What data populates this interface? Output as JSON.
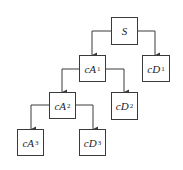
{
  "diagram": {
    "type": "wavelet-decomposition-tree",
    "nodes": [
      {
        "id": "S",
        "base": "S",
        "sub": "",
        "x": 111,
        "y": 17,
        "w": 27,
        "h": 28
      },
      {
        "id": "cA1",
        "base": "cA",
        "sub": "1",
        "x": 79,
        "y": 55,
        "w": 27,
        "h": 27
      },
      {
        "id": "cD1",
        "base": "cD",
        "sub": "1",
        "x": 142,
        "y": 55,
        "w": 28,
        "h": 27
      },
      {
        "id": "cA2",
        "base": "cA",
        "sub": "2",
        "x": 49,
        "y": 92,
        "w": 27,
        "h": 27
      },
      {
        "id": "cD2",
        "base": "cD",
        "sub": "2",
        "x": 111,
        "y": 92,
        "w": 27,
        "h": 28
      },
      {
        "id": "cA3",
        "base": "cA",
        "sub": "3",
        "x": 17,
        "y": 129,
        "w": 27,
        "h": 27
      },
      {
        "id": "cD3",
        "base": "cD",
        "sub": "3",
        "x": 79,
        "y": 129,
        "w": 27,
        "h": 27
      }
    ],
    "edges": [
      {
        "from": "S",
        "to": "cA1"
      },
      {
        "from": "S",
        "to": "cD1"
      },
      {
        "from": "cA1",
        "to": "cA2"
      },
      {
        "from": "cA1",
        "to": "cD2"
      },
      {
        "from": "cA2",
        "to": "cA3"
      },
      {
        "from": "cA2",
        "to": "cD3"
      }
    ],
    "colors": {
      "stroke": "#3a3a3a",
      "fill": "#ffffff",
      "text": "#222222"
    }
  },
  "labels": {
    "S": {
      "base": "S",
      "sub": ""
    },
    "cA1": {
      "base": "cA",
      "sub": "1"
    },
    "cD1": {
      "base": "cD",
      "sub": "1"
    },
    "cA2": {
      "base": "cA",
      "sub": "2"
    },
    "cD2": {
      "base": "cD",
      "sub": "2"
    },
    "cA3": {
      "base": "cA",
      "sub": "3"
    },
    "cD3": {
      "base": "cD",
      "sub": "3"
    }
  }
}
